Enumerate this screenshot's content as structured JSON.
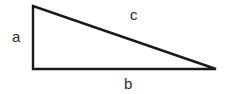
{
  "figure": {
    "type": "right-triangle-diagram",
    "background_color": "#ffffff",
    "stroke_color": "#1a1a1a",
    "stroke_width": 2.4,
    "label_color": "#2b2b2b",
    "width": 229,
    "height": 94
  },
  "vertices": {
    "top_left": {
      "x": 33,
      "y": 6
    },
    "bottom_left": {
      "x": 33,
      "y": 69
    },
    "bottom_right": {
      "x": 216,
      "y": 69
    }
  },
  "sides": [
    {
      "id": "a",
      "label": "a",
      "role": "vertical-leg",
      "from": "top_left",
      "to": "bottom_left",
      "label_position": {
        "x": 12,
        "y": 29
      }
    },
    {
      "id": "b",
      "label": "b",
      "role": "horizontal-leg",
      "from": "bottom_left",
      "to": "bottom_right",
      "label_position": {
        "x": 124,
        "y": 76
      }
    },
    {
      "id": "c",
      "label": "c",
      "role": "hypotenuse",
      "from": "top_left",
      "to": "bottom_right",
      "label_position": {
        "x": 130,
        "y": 7
      }
    }
  ]
}
